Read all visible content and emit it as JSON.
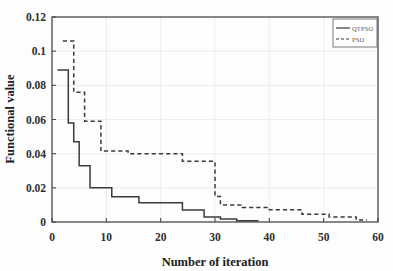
{
  "chart_data": {
    "type": "line",
    "title": "",
    "xlabel": "Number of iteration",
    "ylabel": "Functional value",
    "xlim": [
      0,
      60
    ],
    "ylim": [
      0,
      0.12
    ],
    "xticks": [
      "0",
      "10",
      "20",
      "30",
      "40",
      "50",
      "60"
    ],
    "xtick_values": [
      0,
      10,
      20,
      30,
      40,
      50,
      60
    ],
    "yticks": [
      "0",
      "0.02",
      "0.04",
      "0.06",
      "0.08",
      "0.1",
      "0.12"
    ],
    "ytick_values": [
      0,
      0.02,
      0.04,
      0.06,
      0.08,
      0.1,
      0.12
    ],
    "grid": true,
    "legend_position": "top-right",
    "series": [
      {
        "name": "QTPSO",
        "style": "solid",
        "color": "#3b3b3b",
        "x": [
          1,
          1,
          3,
          3,
          4,
          4,
          5,
          5,
          7,
          7,
          11,
          11,
          16,
          16,
          24,
          24,
          28,
          28,
          31,
          31,
          34,
          34,
          38
        ],
        "y": [
          0.089,
          0.089,
          0.089,
          0.058,
          0.058,
          0.047,
          0.047,
          0.033,
          0.033,
          0.02,
          0.02,
          0.0148,
          0.0148,
          0.0112,
          0.0112,
          0.007,
          0.007,
          0.003,
          0.003,
          0.0018,
          0.0018,
          0.0008,
          0.0008
        ]
      },
      {
        "name": "PSO",
        "style": "dashed",
        "color": "#3b3b3b",
        "x": [
          2,
          2,
          4,
          4,
          6,
          6,
          9,
          9,
          14,
          14,
          24,
          24,
          30,
          30,
          31,
          31,
          35,
          35,
          40,
          40,
          46,
          46,
          51,
          51,
          56,
          56,
          58
        ],
        "y": [
          0.106,
          0.106,
          0.106,
          0.076,
          0.076,
          0.059,
          0.059,
          0.0415,
          0.0415,
          0.04,
          0.04,
          0.0355,
          0.0355,
          0.015,
          0.015,
          0.01,
          0.01,
          0.0085,
          0.0085,
          0.0072,
          0.0072,
          0.0045,
          0.0045,
          0.003,
          0.003,
          0.0012,
          0.0012
        ]
      }
    ]
  },
  "legend": {
    "entries": [
      {
        "label": "QTPSO",
        "style": "solid"
      },
      {
        "label": "PSO",
        "style": "dashed"
      }
    ]
  },
  "axes": {
    "x_title": "Number of iteration",
    "y_title": "Functional value"
  },
  "colors": {
    "ink": "#3b3b3b",
    "axis": "#4a4a4a",
    "grid": "#e9e9e9",
    "background": "#fdfdfd"
  }
}
